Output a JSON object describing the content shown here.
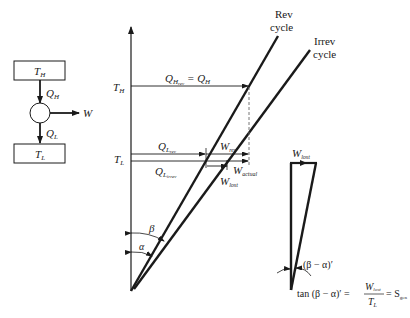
{
  "engine_schematic": {
    "hot_reservoir": {
      "label": "T",
      "sub": "H"
    },
    "cold_reservoir": {
      "label": "T",
      "sub": "L"
    },
    "heat_in": {
      "label": "Q",
      "sub": "H"
    },
    "heat_out": {
      "label": "Q",
      "sub": "L"
    },
    "work": {
      "label": "W"
    }
  },
  "diagram": {
    "axis_labels": {
      "TH": {
        "label": "T",
        "sub": "H"
      },
      "TL": {
        "label": "T",
        "sub": "L"
      }
    },
    "lines": {
      "rev": {
        "label_line1": "Rev",
        "label_line2": "cycle"
      },
      "irrev": {
        "label_line1": "Irrev",
        "label_line2": "cycle"
      }
    },
    "annotations": {
      "QH_eq": {
        "q": "Q",
        "sub": "H",
        "subsub": "rev",
        "eq": " = Q",
        "eq_sub": "H"
      },
      "QL_rev": {
        "q": "Q",
        "sub": "L",
        "subsub": "rev"
      },
      "QL_irrev": {
        "q": "Q",
        "sub": "L",
        "subsub": "irrev"
      },
      "W_rev": {
        "w": "W",
        "sub": "rev"
      },
      "W_actual": {
        "w": "W",
        "sub": "actual"
      },
      "W_lost": {
        "w": "W",
        "sub": "lost"
      },
      "beta": "β",
      "alpha": "α"
    }
  },
  "inset_triangle": {
    "top_label": {
      "w": "W",
      "sub": "lost"
    },
    "angle_label": "(β − α)′",
    "equation": {
      "lhs": "tan (β − α)′ =",
      "num_w": "W",
      "num_sub": "lost",
      "den_t": "T",
      "den_sub": "L",
      "rhs": "= S",
      "rhs_sub": "gen"
    }
  }
}
